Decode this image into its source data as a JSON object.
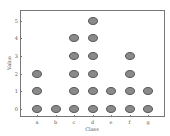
{
  "chart_data": {
    "type": "scatter",
    "subtype": "dot-plot",
    "title": "",
    "xlabel": "Class",
    "ylabel": "Value",
    "categories": [
      "a",
      "b",
      "c",
      "d",
      "e",
      "f",
      "g"
    ],
    "counts": [
      3,
      1,
      5,
      6,
      2,
      4,
      2
    ],
    "points": [
      {
        "x": "a",
        "y": 0
      },
      {
        "x": "a",
        "y": 1
      },
      {
        "x": "a",
        "y": 2
      },
      {
        "x": "b",
        "y": 0
      },
      {
        "x": "c",
        "y": 0
      },
      {
        "x": "c",
        "y": 1
      },
      {
        "x": "c",
        "y": 2
      },
      {
        "x": "c",
        "y": 3
      },
      {
        "x": "c",
        "y": 4
      },
      {
        "x": "d",
        "y": 0
      },
      {
        "x": "d",
        "y": 1
      },
      {
        "x": "d",
        "y": 2
      },
      {
        "x": "d",
        "y": 3
      },
      {
        "x": "d",
        "y": 4
      },
      {
        "x": "d",
        "y": 5
      },
      {
        "x": "e",
        "y": 0
      },
      {
        "x": "e",
        "y": 1
      },
      {
        "x": "f",
        "y": 0
      },
      {
        "x": "f",
        "y": 1
      },
      {
        "x": "f",
        "y": 2
      },
      {
        "x": "f",
        "y": 3
      },
      {
        "x": "g",
        "y": 0
      },
      {
        "x": "g",
        "y": 1
      }
    ],
    "yticks": [
      0,
      1,
      2,
      3,
      4,
      5
    ],
    "ylim": [
      -0.5,
      5.5
    ],
    "grid": false,
    "legend": null,
    "marker_color": "#8a8a8a"
  },
  "axes": {
    "xlabel": "Class",
    "ylabel": "Value",
    "yticks": [
      "0",
      "1",
      "2",
      "3",
      "4",
      "5"
    ],
    "xticks": [
      "a",
      "b",
      "c",
      "d",
      "e",
      "f",
      "g"
    ]
  }
}
